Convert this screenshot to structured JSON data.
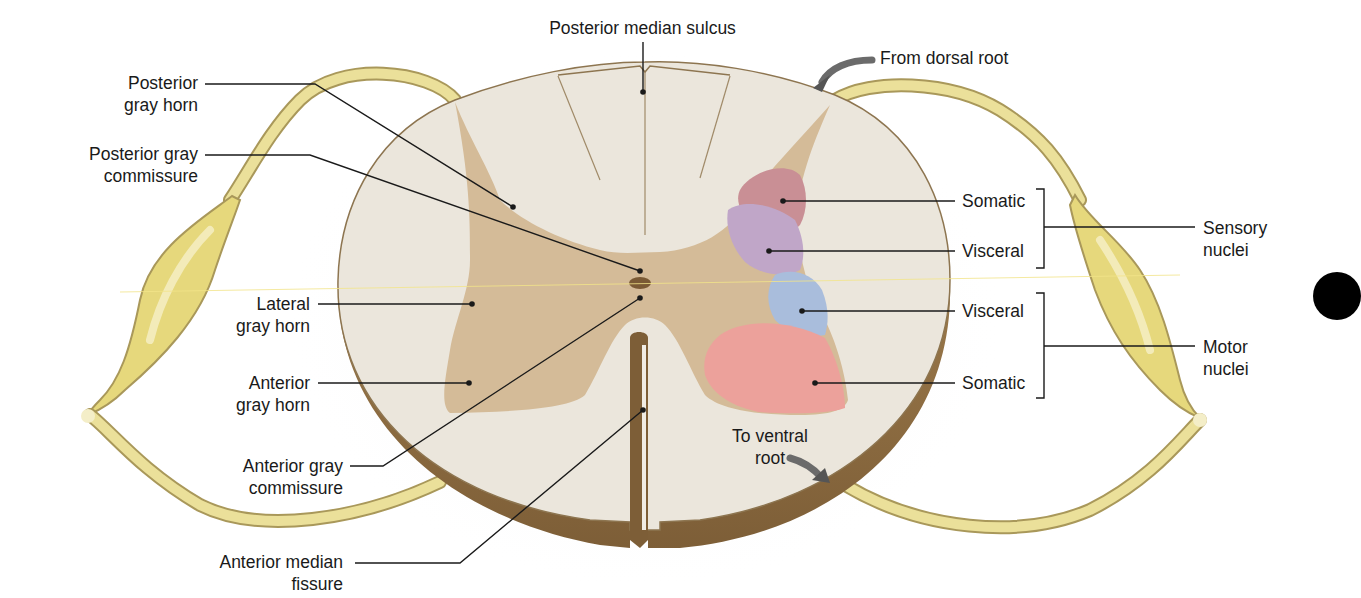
{
  "figure": {
    "colors": {
      "white_matter": "#ebe6dc",
      "gray_matter": "#d4bb98",
      "cut_edge": "#8a6a3f",
      "nerve": "#e8dc8c",
      "nerve_outline": "#a9985a",
      "somatic_sensory": "#c98f95",
      "visceral_sensory": "#c0a6c8",
      "visceral_motor": "#a9bddc",
      "somatic_motor": "#eca19b",
      "central_canal": "#7a5a35",
      "arrow": "#6b6b6b",
      "leader_line": "#1a1a1a"
    }
  },
  "labels": {
    "posterior_median_sulcus": "Posterior median sulcus",
    "from_dorsal_root": "From dorsal root",
    "posterior_gray_horn": [
      "Posterior",
      "gray horn"
    ],
    "posterior_gray_commissure": [
      "Posterior gray",
      "commissure"
    ],
    "lateral_gray_horn": [
      "Lateral",
      "gray horn"
    ],
    "anterior_gray_horn": [
      "Anterior",
      "gray horn"
    ],
    "anterior_gray_commissure": [
      "Anterior gray",
      "commissure"
    ],
    "anterior_median_fissure": [
      "Anterior median",
      "fissure"
    ],
    "to_ventral_root": [
      "To ventral",
      "root"
    ],
    "sensory_somatic": "Somatic",
    "sensory_visceral": "Visceral",
    "motor_visceral": "Visceral",
    "motor_somatic": "Somatic",
    "sensory_nuclei": [
      "Sensory",
      "nuclei"
    ],
    "motor_nuclei": [
      "Motor",
      "nuclei"
    ]
  }
}
